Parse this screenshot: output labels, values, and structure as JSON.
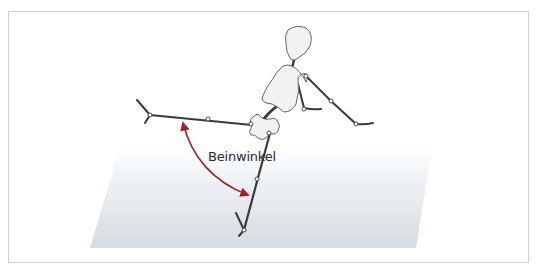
{
  "diagram": {
    "type": "illustration",
    "annotation": {
      "label": "Beinwinkel",
      "arrow_color": "#a4232a",
      "meaning": "angle between the two legs"
    },
    "colors": {
      "limb": "#3a3a3a",
      "joint_fill": "#ffffff",
      "body_fill": "#f2f2f2",
      "floor_top": "#ffffff",
      "floor_bottom": "#d6dbe0",
      "frame_border": "#cfcfcf"
    }
  }
}
